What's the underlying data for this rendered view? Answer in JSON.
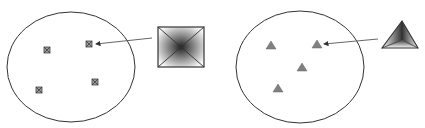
{
  "diagram": {
    "panels": [
      {
        "id": "left",
        "boundary": {
          "shape": "ellipse",
          "cx": 71,
          "cy": 67,
          "rx": 64,
          "ry": 55,
          "stroke": "#333333"
        },
        "markers": {
          "shape": "square-pyramid",
          "fill": "#8a8a8a",
          "positions": [
            [
              47,
              50
            ],
            [
              89,
              44
            ],
            [
              39,
              90
            ],
            [
              95,
              82
            ]
          ]
        },
        "callout": {
          "shape": "square-pyramid-enlarged",
          "x": 158,
          "y": 27,
          "size": 46,
          "arrow_from": [
            152,
            38
          ],
          "arrow_to": [
            96,
            44
          ]
        }
      },
      {
        "id": "right",
        "boundary": {
          "shape": "ellipse",
          "cx": 300,
          "cy": 67,
          "rx": 64,
          "ry": 56,
          "stroke": "#333333"
        },
        "markers": {
          "shape": "triangle-pyramid",
          "fill": "#808080",
          "positions": [
            [
              271,
              45
            ],
            [
              317,
              44
            ],
            [
              302,
              67
            ],
            [
              278,
              88
            ]
          ]
        },
        "callout": {
          "shape": "triangle-pyramid-enlarged",
          "apex": [
            402,
            21
          ],
          "left": [
            382,
            48
          ],
          "right": [
            418,
            48
          ],
          "arrow_from": [
            378,
            39
          ],
          "arrow_to": [
            324,
            44
          ]
        }
      }
    ],
    "colors": {
      "stroke": "#333333",
      "marker_fill": "#888888",
      "gradient_dark": "#2a2a2a",
      "gradient_light": "#f5f5f5"
    }
  }
}
